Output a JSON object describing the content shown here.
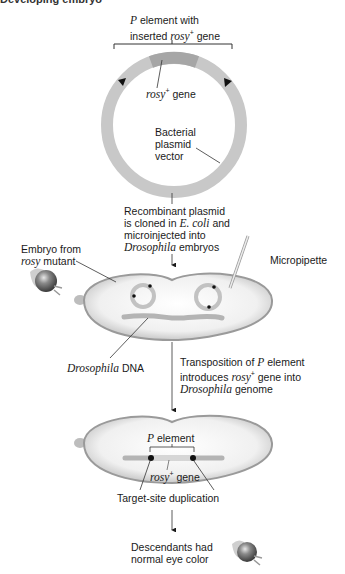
{
  "header": {
    "title_cut": "Developing embryo"
  },
  "plasmid": {
    "p_element_label_prefix": "P",
    "p_element_label_rest": " element with",
    "p_element_line2_prefix": "inserted ",
    "p_element_line2_gene": "rosy",
    "p_element_line2_sup": "+",
    "p_element_line2_suffix": " gene",
    "rosy_gene_italic": "rosy",
    "rosy_gene_sup": "+",
    "rosy_gene_suffix": " gene",
    "vector_line1": "Bacterial",
    "vector_line2": "plasmid",
    "vector_line3": "vector"
  },
  "step1": {
    "line1": "Recombinant plasmid",
    "line2_prefix": "is cloned in ",
    "line2_italic": "E. coli",
    "line2_suffix": " and",
    "line3": "microinjected into",
    "line4_italic": "Drosophila",
    "line4_suffix": " embryos"
  },
  "embryo1": {
    "label_line1": "Embryo from",
    "label_line2_italic": "rosy",
    "label_line2_suffix": " mutant",
    "pipette_label": "Micropipette",
    "dna_label_italic": "Drosophila",
    "dna_label_suffix": " DNA"
  },
  "step2": {
    "line1_prefix": "Transposition of ",
    "line1_italic": "P",
    "line1_suffix": " element",
    "line2_prefix": "introduces ",
    "line2_italic": "rosy",
    "line2_sup": "+",
    "line2_suffix": " gene into",
    "line3_italic": "Drosophila",
    "line3_suffix": " genome"
  },
  "embryo2": {
    "p_element_italic": "P",
    "p_element_suffix": " element",
    "gene_italic": "rosy",
    "gene_sup": "+",
    "gene_suffix": " gene",
    "duplication_label": "Target-site duplication"
  },
  "result": {
    "line1": "Descendants had",
    "line2": "normal eye color"
  },
  "colors": {
    "ring": "#c8c8c8",
    "rosy_segment": "#a8a8a8",
    "embryo_fill": "#f2f2f2",
    "embryo_edge": "#9a9a9a",
    "dna": "#b4b4b4",
    "ink": "#1a1a1a"
  }
}
